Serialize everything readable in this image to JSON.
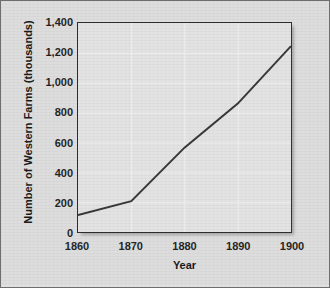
{
  "chart_data": {
    "type": "line",
    "title": "",
    "xlabel": "Year",
    "ylabel": "Number of Western Farms (thousands)",
    "x": [
      1860,
      1870,
      1880,
      1890,
      1900
    ],
    "values": [
      113,
      207,
      565,
      860,
      1245
    ],
    "series": [
      {
        "name": "Number of Western Farms (thousands)",
        "values": [
          113,
          207,
          565,
          860,
          1245
        ]
      }
    ],
    "xlim": [
      1860,
      1900
    ],
    "ylim": [
      0,
      1400
    ],
    "xticks": [
      1860,
      1870,
      1880,
      1890,
      1900
    ],
    "xtick_labels": [
      "1860",
      "1870",
      "1880",
      "1890",
      "1900"
    ],
    "yticks": [
      0,
      200,
      400,
      600,
      800,
      1000,
      1200,
      1400
    ],
    "ytick_labels": [
      "0",
      "200",
      "400",
      "600",
      "800",
      "1,000",
      "1,200",
      "1,400"
    ],
    "grid": true,
    "legend": "none",
    "markers": "none",
    "line_color": "#333333",
    "plot_background": "#e2e2e2",
    "grid_color": "#f2f2f2",
    "figure_background": "#dcdcdc",
    "axis_color": "#2b2b2b"
  }
}
